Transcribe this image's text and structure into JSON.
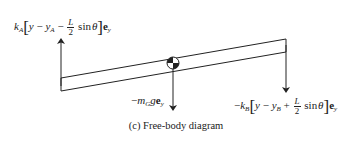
{
  "figure": {
    "caption": "(c) Free-body diagram",
    "colors": {
      "stroke": "#222222",
      "background": "#ffffff"
    }
  },
  "forces": {
    "spring_a": {
      "coef": "k",
      "coef_sub": "A",
      "var": "y",
      "minus1": " − ",
      "var2": "y",
      "var2_sub": "A",
      "op": " − ",
      "frac_num": "L",
      "frac_den": "2",
      "trig": "sin",
      "angle": "θ",
      "unit": "e",
      "unit_sub": "y",
      "lbracket": "[",
      "rbracket": "]"
    },
    "gravity": {
      "sign": "−",
      "mass": "m",
      "mass_sub": "G",
      "g": "g",
      "unit": "e",
      "unit_sub": "y"
    },
    "spring_b": {
      "sign": "−",
      "coef": "k",
      "coef_sub": "B",
      "var": "y",
      "minus1": " − ",
      "var2": "y",
      "var2_sub": "B",
      "op": " + ",
      "frac_num": "L",
      "frac_den": "2",
      "trig": "sin",
      "angle": "θ",
      "unit": "e",
      "unit_sub": "y",
      "lbracket": "[",
      "rbracket": "]"
    }
  },
  "icons": {
    "center_of_mass": "center-of-mass-symbol",
    "arrow_up": "arrow-up-icon",
    "arrow_down": "arrow-down-icon"
  }
}
